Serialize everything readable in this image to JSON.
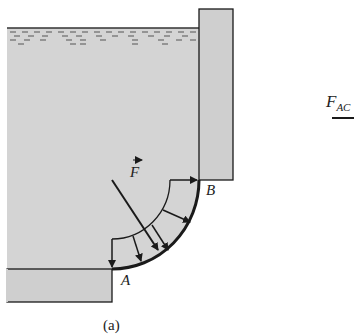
{
  "figure": {
    "caption": "(a)",
    "labels": {
      "force": "F",
      "point_a": "A",
      "point_b": "B",
      "force_ac": "F",
      "force_ac_sub": "AC"
    },
    "colors": {
      "water": "#d4d4d4",
      "wall": "#cfcfcf",
      "stroke": "#1a1a1a"
    }
  }
}
